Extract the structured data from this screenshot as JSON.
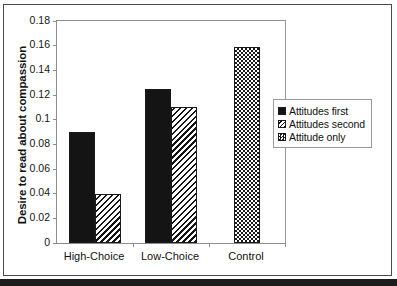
{
  "chart_data": {
    "type": "bar",
    "title": "",
    "xlabel": "",
    "ylabel": "Desire to read about compassion",
    "categories": [
      "High-Choice",
      "Low-Choice",
      "Control"
    ],
    "series": [
      {
        "name": "Attitudes  first",
        "pattern": "solid",
        "values": [
          0.09,
          0.125,
          null
        ]
      },
      {
        "name": "Attitudes  second",
        "pattern": "diagonal-hatch",
        "values": [
          0.04,
          0.11,
          null
        ]
      },
      {
        "name": "Attitude  only",
        "pattern": "checkered",
        "values": [
          null,
          null,
          0.159
        ]
      }
    ],
    "ylim": [
      0,
      0.18
    ],
    "ytick_step": 0.02,
    "ytick_labels": [
      "0.18",
      "0.16",
      "0.14",
      "0.12",
      "0.1",
      "0.08",
      "0.06",
      "0.04",
      "0.02",
      "0"
    ],
    "ytick_values": [
      0.18,
      0.16,
      0.14,
      0.12,
      0.1,
      0.08,
      0.06,
      0.04,
      0.02,
      0
    ],
    "grid": false,
    "legend_position": "right"
  },
  "legend": {
    "items": [
      {
        "label": "Attitudes  first",
        "swatch": "solid-black-swatch"
      },
      {
        "label": "Attitudes  second",
        "swatch": "diagonal-hatch-swatch"
      },
      {
        "label": "Attitude  only",
        "swatch": "checkered-swatch"
      }
    ]
  },
  "axes": {
    "y_title": "Desire to read about compassion",
    "y_labels": [
      "0.18",
      "0.16",
      "0.14",
      "0.12",
      "0.1",
      "0.08",
      "0.06",
      "0.04",
      "0.02",
      "0"
    ],
    "x_labels": [
      "High-Choice",
      "Low-Choice",
      "Control"
    ]
  },
  "colors": {
    "ink": "#141414",
    "frame": "#8d8d8d",
    "page_border": "#4a4a4a",
    "background": "#ffffff"
  }
}
